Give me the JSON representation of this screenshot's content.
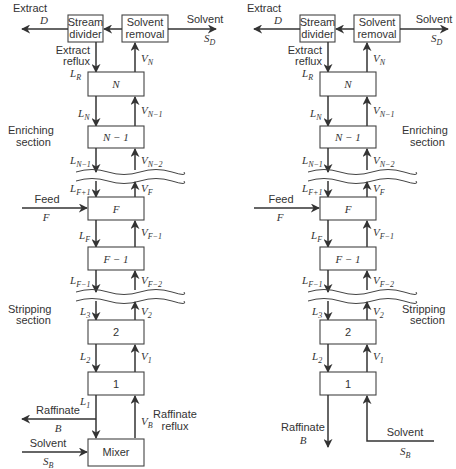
{
  "diagrams": [
    {
      "id": "with-raffinate-reflux",
      "top": {
        "extract_label": "Extract",
        "extract_var": "D",
        "stream_divider": [
          "Stream",
          "divider"
        ],
        "solvent_removal": [
          "Solvent",
          "removal"
        ],
        "solvent_label": "Solvent",
        "solvent_var": "S",
        "solvent_sub": "D",
        "reflux_label": [
          "Extract",
          "reflux"
        ],
        "reflux_var": "L",
        "reflux_sub": "R"
      },
      "stages": [
        "N",
        "N − 1",
        "F",
        "F − 1",
        "2",
        "1"
      ],
      "streams": {
        "VN": [
          "V",
          "N"
        ],
        "LN": [
          "L",
          "N"
        ],
        "VN1": [
          "V",
          "N−1"
        ],
        "LN1": [
          "L",
          "N−1"
        ],
        "VN2": [
          "V",
          "N−2"
        ],
        "LF1p": [
          "L",
          "F+1"
        ],
        "VF": [
          "V",
          "F"
        ],
        "LF": [
          "L",
          "F"
        ],
        "VF1": [
          "V",
          "F−1"
        ],
        "LF1m": [
          "L",
          "F−1"
        ],
        "VF2": [
          "V",
          "F−2"
        ],
        "L3": [
          "L",
          "3"
        ],
        "V2": [
          "V",
          "2"
        ],
        "L2": [
          "L",
          "2"
        ],
        "V1": [
          "V",
          "1"
        ],
        "L1": [
          "L",
          "1"
        ],
        "VB": [
          "V",
          "B"
        ]
      },
      "sections": {
        "enriching": [
          "Enriching",
          "section"
        ],
        "stripping": [
          "Stripping",
          "section"
        ]
      },
      "feed": {
        "label": "Feed",
        "var": "F"
      },
      "bottom": {
        "raffinate_label": "Raffinate",
        "raffinate_var": "B",
        "raffinate_reflux": [
          "Raffinate",
          "reflux"
        ],
        "solvent_label": "Solvent",
        "solvent_var": "S",
        "solvent_sub": "B",
        "mixer": "Mixer"
      }
    },
    {
      "id": "without-raffinate-reflux",
      "top": {
        "extract_label": "Extract",
        "extract_var": "D",
        "stream_divider": [
          "Stream",
          "divider"
        ],
        "solvent_removal": [
          "Solvent",
          "removal"
        ],
        "solvent_label": "Solvent",
        "solvent_var": "S",
        "solvent_sub": "D",
        "reflux_label": [
          "Extract",
          "reflux"
        ],
        "reflux_var": "L",
        "reflux_sub": "R"
      },
      "stages": [
        "N",
        "N − 1",
        "F",
        "F − 1",
        "2",
        "1"
      ],
      "streams": {
        "VN": [
          "V",
          "N"
        ],
        "LN": [
          "L",
          "N"
        ],
        "VN1": [
          "V",
          "N−1"
        ],
        "LN1": [
          "L",
          "N−1"
        ],
        "VN2": [
          "V",
          "N−2"
        ],
        "LF1p": [
          "L",
          "F+1"
        ],
        "VF": [
          "V",
          "F"
        ],
        "LF": [
          "L",
          "F"
        ],
        "VF1": [
          "V",
          "F−1"
        ],
        "LF1m": [
          "L",
          "F−1"
        ],
        "VF2": [
          "V",
          "F−2"
        ],
        "L3": [
          "L",
          "3"
        ],
        "V2": [
          "V",
          "2"
        ],
        "L2": [
          "L",
          "2"
        ],
        "V1": [
          "V",
          "1"
        ]
      },
      "sections": {
        "enriching": [
          "Enriching",
          "section"
        ],
        "stripping": [
          "Stripping",
          "section"
        ]
      },
      "feed": {
        "label": "Feed",
        "var": "F"
      },
      "bottom": {
        "raffinate_label": "Raffinate",
        "raffinate_var": "B",
        "solvent_label": "Solvent",
        "solvent_var": "S",
        "solvent_sub": "B"
      }
    }
  ]
}
